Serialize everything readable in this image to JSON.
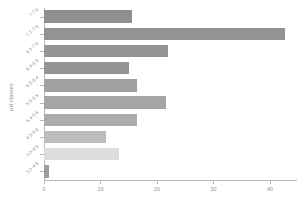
{
  "chart_data": {
    "type": "bar",
    "orientation": "horizontal",
    "title": "",
    "xlabel": "",
    "ylabel": "pH classes",
    "categories": [
      "7-7.6",
      "7.1-7.5",
      "6.5-7.5",
      "6.4-6.5",
      "5.5-6.4",
      "5.5-5.5",
      "5.4-5.5",
      "4.5-5.5",
      "3.5-4.5",
      "3.5-4.5"
    ],
    "values": [
      15.5,
      42.6,
      22.0,
      15.0,
      16.5,
      21.6,
      16.5,
      11.0,
      13.3,
      0.8
    ],
    "bar_colors": [
      "#8f8f8f",
      "#939393",
      "#949494",
      "#949494",
      "#a0a0a0",
      "#a5a5a5",
      "#ababab",
      "#bdbdbd",
      "#dcdcdc",
      "#9d9d9d"
    ],
    "xlim": [
      0,
      44.8
    ],
    "xticks": [
      0,
      10,
      20,
      30,
      40
    ],
    "xticklabels": [
      "0",
      "10",
      "20",
      "30",
      "40"
    ],
    "grid": false,
    "legend": false
  },
  "axis": {
    "y_title": "pH classes",
    "tick_color": "#b9b9b9",
    "label_color": "#8f8f8f"
  }
}
